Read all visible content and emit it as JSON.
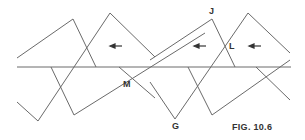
{
  "figure": {
    "caption": "FIG. 10.6",
    "labels": {
      "J": "J",
      "L": "L",
      "M": "M",
      "G": "G"
    },
    "line_color": "#6a6a6a",
    "arrow_direction": "left",
    "arrow_count": 3
  }
}
